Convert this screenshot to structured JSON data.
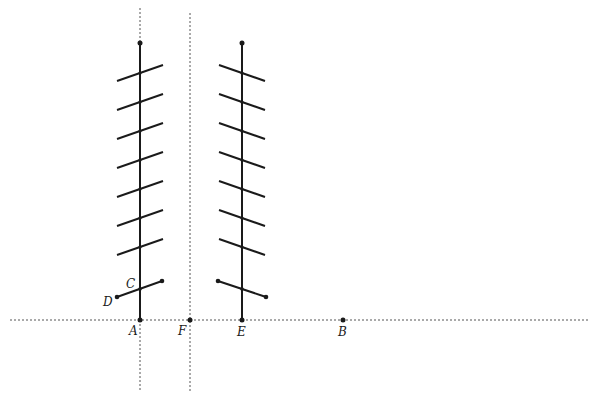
{
  "figure": {
    "title": "",
    "colors": {
      "stroke": "#1a1a1a",
      "dotted": "#555555",
      "background": "#ffffff"
    },
    "labels": {
      "A": "A",
      "B": "B",
      "C": "C",
      "D": "D",
      "E": "E",
      "F": "F"
    },
    "points": {
      "A": [
        140,
        320
      ],
      "B": [
        343,
        320
      ],
      "C": [
        140,
        289
      ],
      "D": [
        117,
        297
      ],
      "E": [
        242,
        320
      ],
      "F": [
        190,
        320
      ]
    },
    "left_shaft": {
      "x": 140,
      "top": 43,
      "bottom": 320,
      "fin_ys": [
        73,
        102,
        131,
        160,
        189,
        218,
        247
      ],
      "fin_half_width": 23,
      "fin_slope_dy": 8
    },
    "right_shaft": {
      "x": 242,
      "top": 43,
      "bottom": 320,
      "fin_ys": [
        73,
        102,
        131,
        160,
        189,
        218,
        247
      ],
      "fin_half_width": 23,
      "fin_slope_dy": 8
    },
    "dotted_lines": {
      "horizontal": {
        "y": 320,
        "x1": 10,
        "x2": 590
      },
      "vertical_A": {
        "x": 140,
        "y1": 8,
        "y2": 392
      },
      "vertical_F": {
        "x": 190,
        "y1": 13,
        "y2": 392
      }
    }
  }
}
